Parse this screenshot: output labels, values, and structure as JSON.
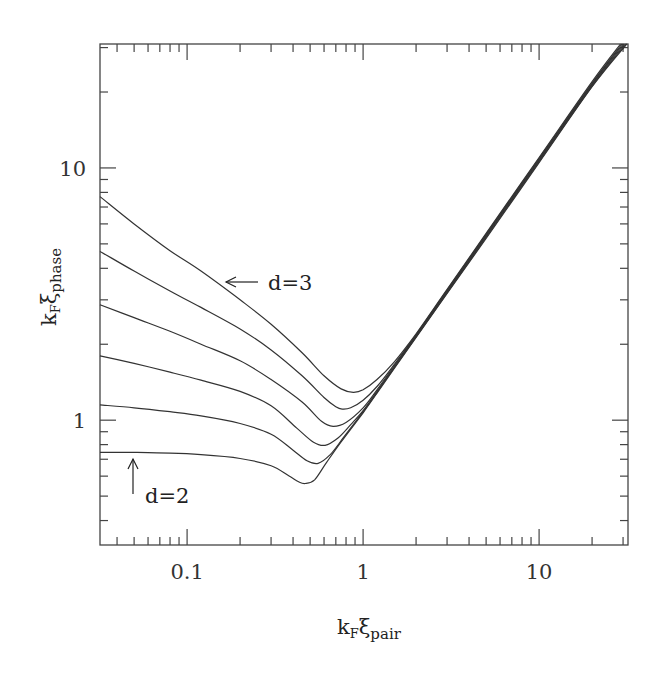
{
  "chart_data": {
    "type": "line",
    "title": "",
    "xlabel": "k_F ξ_pair",
    "ylabel": "k_F ξ_phase",
    "xlabel_parts": {
      "main": "k",
      "sub1": "F",
      "greek": "ξ",
      "sub2": "pair"
    },
    "ylabel_parts": {
      "main": "k",
      "sub1": "F",
      "greek": "ξ",
      "sub2": "phase"
    },
    "xscale": "log",
    "yscale": "log",
    "xlim": [
      0.032,
      32
    ],
    "ylim": [
      0.32,
      31
    ],
    "grid": false,
    "legend": null,
    "x_tick_labels": [
      {
        "value": 0.1,
        "label": "0.1"
      },
      {
        "value": 1,
        "label": "1"
      },
      {
        "value": 10,
        "label": "10"
      }
    ],
    "y_tick_labels": [
      {
        "value": 1,
        "label": "1"
      },
      {
        "value": 10,
        "label": "10"
      }
    ],
    "annotations": [
      {
        "text": "d=3",
        "arrow": "left",
        "arrow_tip": [
          0.21,
          3.6
        ],
        "note": "points to top curve"
      },
      {
        "text": "d=2",
        "arrow": "up",
        "arrow_tip": [
          0.05,
          0.8
        ],
        "note": "points to bottom curve"
      }
    ],
    "series": [
      {
        "name": "d=3",
        "points": [
          [
            0.032,
            7.7
          ],
          [
            0.05,
            6.0
          ],
          [
            0.08,
            4.7
          ],
          [
            0.12,
            3.9
          ],
          [
            0.2,
            3.0
          ],
          [
            0.3,
            2.4
          ],
          [
            0.45,
            1.85
          ],
          [
            0.6,
            1.5
          ],
          [
            0.75,
            1.33
          ],
          [
            0.88,
            1.29
          ],
          [
            1.0,
            1.32
          ],
          [
            1.2,
            1.45
          ],
          [
            1.5,
            1.7
          ],
          [
            2,
            2.2
          ],
          [
            3,
            3.3
          ],
          [
            5,
            5.5
          ],
          [
            10,
            11
          ],
          [
            20,
            22
          ],
          [
            29,
            31
          ]
        ]
      },
      {
        "name": "d=2.8",
        "points": [
          [
            0.032,
            4.67
          ],
          [
            0.05,
            3.9
          ],
          [
            0.08,
            3.25
          ],
          [
            0.12,
            2.8
          ],
          [
            0.2,
            2.3
          ],
          [
            0.3,
            1.9
          ],
          [
            0.45,
            1.5
          ],
          [
            0.6,
            1.23
          ],
          [
            0.7,
            1.13
          ],
          [
            0.76,
            1.106
          ],
          [
            0.85,
            1.12
          ],
          [
            1.0,
            1.2
          ],
          [
            1.2,
            1.36
          ],
          [
            1.5,
            1.66
          ],
          [
            2,
            2.18
          ],
          [
            3,
            3.28
          ],
          [
            5,
            5.45
          ],
          [
            10,
            10.9
          ],
          [
            20,
            21.7
          ],
          [
            29.5,
            31
          ]
        ]
      },
      {
        "name": "d=2.6",
        "points": [
          [
            0.032,
            2.87
          ],
          [
            0.05,
            2.55
          ],
          [
            0.08,
            2.25
          ],
          [
            0.12,
            2.0
          ],
          [
            0.2,
            1.72
          ],
          [
            0.3,
            1.45
          ],
          [
            0.45,
            1.18
          ],
          [
            0.58,
            0.99
          ],
          [
            0.675,
            0.946
          ],
          [
            0.8,
            0.98
          ],
          [
            1.0,
            1.12
          ],
          [
            1.2,
            1.32
          ],
          [
            1.5,
            1.64
          ],
          [
            2,
            2.16
          ],
          [
            3,
            3.25
          ],
          [
            5,
            5.4
          ],
          [
            10,
            10.8
          ],
          [
            20,
            21.5
          ],
          [
            30,
            31
          ]
        ]
      },
      {
        "name": "d=2.4",
        "points": [
          [
            0.032,
            1.8
          ],
          [
            0.05,
            1.68
          ],
          [
            0.08,
            1.55
          ],
          [
            0.12,
            1.44
          ],
          [
            0.2,
            1.3
          ],
          [
            0.3,
            1.14
          ],
          [
            0.42,
            0.93
          ],
          [
            0.52,
            0.82
          ],
          [
            0.608,
            0.795
          ],
          [
            0.72,
            0.85
          ],
          [
            0.85,
            0.96
          ],
          [
            1.0,
            1.09
          ],
          [
            1.2,
            1.3
          ],
          [
            1.5,
            1.62
          ],
          [
            2,
            2.15
          ],
          [
            3,
            3.22
          ],
          [
            5,
            5.35
          ],
          [
            10,
            10.7
          ],
          [
            20,
            21.3
          ],
          [
            30.5,
            31
          ]
        ]
      },
      {
        "name": "d=2.2",
        "points": [
          [
            0.032,
            1.15
          ],
          [
            0.05,
            1.12
          ],
          [
            0.08,
            1.08
          ],
          [
            0.12,
            1.04
          ],
          [
            0.2,
            0.97
          ],
          [
            0.3,
            0.88
          ],
          [
            0.4,
            0.76
          ],
          [
            0.48,
            0.69
          ],
          [
            0.555,
            0.674
          ],
          [
            0.65,
            0.73
          ],
          [
            0.78,
            0.86
          ],
          [
            1.0,
            1.08
          ],
          [
            1.2,
            1.29
          ],
          [
            1.5,
            1.61
          ],
          [
            2,
            2.14
          ],
          [
            3,
            3.2
          ],
          [
            5,
            5.3
          ],
          [
            10,
            10.6
          ],
          [
            20,
            21.1
          ],
          [
            31,
            31
          ]
        ]
      },
      {
        "name": "d=2",
        "points": [
          [
            0.032,
            0.746
          ],
          [
            0.05,
            0.745
          ],
          [
            0.08,
            0.74
          ],
          [
            0.12,
            0.73
          ],
          [
            0.2,
            0.705
          ],
          [
            0.3,
            0.66
          ],
          [
            0.38,
            0.6
          ],
          [
            0.43,
            0.57
          ],
          [
            0.468,
            0.561
          ],
          [
            0.53,
            0.58
          ],
          [
            0.62,
            0.68
          ],
          [
            0.75,
            0.82
          ],
          [
            1.0,
            1.07
          ],
          [
            1.2,
            1.28
          ],
          [
            1.5,
            1.6
          ],
          [
            2,
            2.13
          ],
          [
            3,
            3.18
          ],
          [
            5,
            5.25
          ],
          [
            10,
            10.5
          ],
          [
            20,
            21
          ],
          [
            31.5,
            31
          ]
        ]
      }
    ]
  }
}
